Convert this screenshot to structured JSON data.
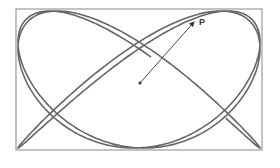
{
  "diagram": {
    "frame": {
      "x": 16,
      "y": 9,
      "w": 246,
      "h": 141,
      "color": "#888888"
    },
    "curve": {
      "color": "#666666",
      "freq_x": 3,
      "freq_y": 4,
      "phase": 0.35,
      "t_start": 0.15,
      "t_end": 6.2
    },
    "center": {
      "x": 140,
      "y": 83
    },
    "point": {
      "label": "P",
      "x": 196,
      "y": 20
    },
    "arrow_color": "#333333"
  }
}
